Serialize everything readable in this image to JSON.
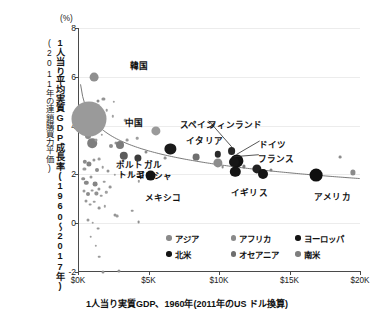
{
  "chart_data": {
    "type": "scatter",
    "title": "",
    "unit_label": "(%)",
    "xlabel": "1人当り実質GDP、1960年(2011年のUS ドル換算)",
    "ylabel": "1人当り平均実質GDP成長率(1960〜2017年)",
    "ylabel_sub": "(2011年の連鎖購買力平価)",
    "xlim": [
      0,
      20000
    ],
    "ylim": [
      -2,
      8
    ],
    "grid": true,
    "legend_position": "inside-bottom-right",
    "xticks": [
      {
        "value": 0,
        "label": "$0K"
      },
      {
        "value": 5000,
        "label": "$5K"
      },
      {
        "value": 10000,
        "label": "$10K"
      },
      {
        "value": 15000,
        "label": "$15K"
      },
      {
        "value": 20000,
        "label": "$20K"
      }
    ],
    "yticks": [
      {
        "value": -2,
        "label": "-2"
      },
      {
        "value": 0,
        "label": "0"
      },
      {
        "value": 2,
        "label": "2"
      },
      {
        "value": 4,
        "label": "4"
      },
      {
        "value": 6,
        "label": "6"
      },
      {
        "value": 8,
        "label": "8"
      }
    ],
    "legend": [
      {
        "name": "アジア",
        "color": "#8a8a8a"
      },
      {
        "name": "アフリカ",
        "color": "#8a8a8a"
      },
      {
        "name": "ヨーロッパ",
        "color": "#141414"
      },
      {
        "name": "北米",
        "color": "#141414"
      },
      {
        "name": "オセアニア",
        "color": "#6e6e6e"
      },
      {
        "name": "南米",
        "color": "#7e7e7e"
      }
    ],
    "trend_note": "downward-sloping fitted convergence curve",
    "labeled_points": [
      {
        "label": "韓国",
        "x": 1150,
        "y": 5.98,
        "r": 4.4,
        "color": "#8f8f8f",
        "lx": 36,
        "ly": -13,
        "leader": false
      },
      {
        "label": "中国",
        "x": 800,
        "y": 4.28,
        "r": 17.5,
        "color": "#9a9a9a",
        "lx": 36,
        "ly": 2,
        "leader": false
      },
      {
        "label": "ポルトガル",
        "x": 3000,
        "y": 3.22,
        "r": 4.0,
        "color": "#7b7b7b",
        "lx": -4,
        "ly": 18,
        "leader": false
      },
      {
        "label": "トルコ",
        "x": 3250,
        "y": 2.75,
        "r": 4.2,
        "color": "#5c5c5c",
        "lx": -6,
        "ly": 17,
        "leader": false
      },
      {
        "label": "スペイン",
        "x": 5500,
        "y": 3.78,
        "r": 4.6,
        "color": "#9a9a9a",
        "lx": 24,
        "ly": -8,
        "leader": false
      },
      {
        "label": "イタリア",
        "x": 6550,
        "y": 3.06,
        "r": 5.6,
        "color": "#1a1a1a",
        "lx": 16,
        "ly": -10,
        "leader": false
      },
      {
        "label": "ギリシャ",
        "x": 4250,
        "y": 2.68,
        "r": 3.6,
        "color": "#3c3c3c",
        "lx": -2,
        "ly": 16,
        "leader": false
      },
      {
        "label": "メキシコ",
        "x": 5150,
        "y": 1.95,
        "r": 5.4,
        "color": "#141414",
        "lx": -6,
        "ly": 20,
        "leader": false
      },
      {
        "label": "フィンランド",
        "x": 10900,
        "y": 2.97,
        "r": 3.9,
        "color": "#262626",
        "lx": -24,
        "ly": -28,
        "leader": true
      },
      {
        "label": "ドイツ",
        "x": 11250,
        "y": 2.55,
        "r": 6.6,
        "color": "#111111",
        "lx": 22,
        "ly": -18,
        "leader": true
      },
      {
        "label": "フランス",
        "x": 11050,
        "y": 2.52,
        "r": 5.0,
        "color": "#161616",
        "lx": 24,
        "ly": -5,
        "leader": true
      },
      {
        "label": "イギリス",
        "x": 11150,
        "y": 2.1,
        "r": 5.2,
        "color": "#141414",
        "lx": -4,
        "ly": 19,
        "leader": false
      },
      {
        "label": "アメリカ",
        "x": 16900,
        "y": 1.96,
        "r": 6.4,
        "color": "#0f0f0f",
        "lx": -2,
        "ly": 20,
        "leader": false
      }
    ],
    "unlabeled_points": [
      {
        "x": 1400,
        "y": 5.02,
        "r": 1.5,
        "color": "#8d8d8d"
      },
      {
        "x": 1800,
        "y": 5.08,
        "r": 1.6,
        "color": "#949494"
      },
      {
        "x": 1550,
        "y": 4.52,
        "r": 1.4,
        "color": "#9d9d9d"
      },
      {
        "x": 2050,
        "y": 4.62,
        "r": 1.3,
        "color": "#9a9a9a"
      },
      {
        "x": 2450,
        "y": 4.38,
        "r": 1.2,
        "color": "#a2a2a2"
      },
      {
        "x": 3350,
        "y": 4.22,
        "r": 1.3,
        "color": "#9c9c9c"
      },
      {
        "x": 700,
        "y": 3.58,
        "r": 3.0,
        "color": "#8a8a8a"
      },
      {
        "x": 1000,
        "y": 3.28,
        "r": 4.8,
        "color": "#7e7e7e"
      },
      {
        "x": 1250,
        "y": 3.4,
        "r": 1.5,
        "color": "#9b9b9b"
      },
      {
        "x": 1700,
        "y": 3.62,
        "r": 1.2,
        "color": "#a0a0a0"
      },
      {
        "x": 2350,
        "y": 3.15,
        "r": 2.0,
        "color": "#8f8f8f"
      },
      {
        "x": 2700,
        "y": 3.3,
        "r": 1.6,
        "color": "#949494"
      },
      {
        "x": 3500,
        "y": 3.4,
        "r": 1.4,
        "color": "#9a9a9a"
      },
      {
        "x": 4200,
        "y": 3.48,
        "r": 1.3,
        "color": "#9e9e9e"
      },
      {
        "x": 4800,
        "y": 2.92,
        "r": 1.5,
        "color": "#8c8c8c"
      },
      {
        "x": 5600,
        "y": 2.52,
        "r": 1.3,
        "color": "#9a9a9a"
      },
      {
        "x": 6200,
        "y": 2.68,
        "r": 1.4,
        "color": "#909090"
      },
      {
        "x": 8400,
        "y": 2.72,
        "r": 3.4,
        "color": "#6f6f6f"
      },
      {
        "x": 9950,
        "y": 2.46,
        "r": 4.6,
        "color": "#8d8d8d"
      },
      {
        "x": 9900,
        "y": 2.82,
        "r": 3.2,
        "color": "#2a2a2a"
      },
      {
        "x": 10250,
        "y": 2.3,
        "r": 1.4,
        "color": "#8e8e8e"
      },
      {
        "x": 11750,
        "y": 2.33,
        "r": 1.6,
        "color": "#7a7a7a"
      },
      {
        "x": 12700,
        "y": 2.24,
        "r": 4.6,
        "color": "#222222"
      },
      {
        "x": 13100,
        "y": 2.02,
        "r": 5.0,
        "color": "#141414"
      },
      {
        "x": 13700,
        "y": 2.18,
        "r": 1.5,
        "color": "#808080"
      },
      {
        "x": 18600,
        "y": 2.72,
        "r": 1.4,
        "color": "#8c8c8c"
      },
      {
        "x": 19500,
        "y": 2.08,
        "r": 2.6,
        "color": "#8a8a8a"
      },
      {
        "x": 500,
        "y": 2.52,
        "r": 2.2,
        "color": "#8b8b8b"
      },
      {
        "x": 450,
        "y": 2.22,
        "r": 1.6,
        "color": "#9a9a9a"
      },
      {
        "x": 800,
        "y": 2.42,
        "r": 2.6,
        "color": "#838383"
      },
      {
        "x": 1100,
        "y": 2.6,
        "r": 1.6,
        "color": "#969696"
      },
      {
        "x": 1350,
        "y": 2.18,
        "r": 2.0,
        "color": "#8d8d8d"
      },
      {
        "x": 1500,
        "y": 2.62,
        "r": 1.4,
        "color": "#9b9b9b"
      },
      {
        "x": 1750,
        "y": 2.3,
        "r": 1.3,
        "color": "#9e9e9e"
      },
      {
        "x": 2100,
        "y": 2.12,
        "r": 1.5,
        "color": "#949494"
      },
      {
        "x": 2600,
        "y": 1.98,
        "r": 1.2,
        "color": "#a0a0a0"
      },
      {
        "x": 3100,
        "y": 2.02,
        "r": 1.3,
        "color": "#999999"
      },
      {
        "x": 3700,
        "y": 2.06,
        "r": 1.4,
        "color": "#939393"
      },
      {
        "x": 4300,
        "y": 1.72,
        "r": 1.2,
        "color": "#9e9e9e"
      },
      {
        "x": 350,
        "y": 1.82,
        "r": 1.8,
        "color": "#8e8e8e"
      },
      {
        "x": 600,
        "y": 1.66,
        "r": 2.2,
        "color": "#888888"
      },
      {
        "x": 900,
        "y": 1.88,
        "r": 1.5,
        "color": "#979797"
      },
      {
        "x": 1200,
        "y": 1.6,
        "r": 2.4,
        "color": "#858585"
      },
      {
        "x": 1500,
        "y": 1.42,
        "r": 1.6,
        "color": "#949494"
      },
      {
        "x": 1850,
        "y": 1.7,
        "r": 1.3,
        "color": "#9c9c9c"
      },
      {
        "x": 2300,
        "y": 1.48,
        "r": 1.4,
        "color": "#969696"
      },
      {
        "x": 400,
        "y": 1.3,
        "r": 1.5,
        "color": "#9a9a9a"
      },
      {
        "x": 700,
        "y": 1.18,
        "r": 2.0,
        "color": "#8c8c8c"
      },
      {
        "x": 1000,
        "y": 1.34,
        "r": 1.4,
        "color": "#989898"
      },
      {
        "x": 1300,
        "y": 1.22,
        "r": 1.6,
        "color": "#929292"
      },
      {
        "x": 1650,
        "y": 1.12,
        "r": 1.3,
        "color": "#9d9d9d"
      },
      {
        "x": 2000,
        "y": 1.26,
        "r": 1.2,
        "color": "#a1a1a1"
      },
      {
        "x": 550,
        "y": 0.92,
        "r": 1.5,
        "color": "#979797"
      },
      {
        "x": 850,
        "y": 0.76,
        "r": 1.4,
        "color": "#9a9a9a"
      },
      {
        "x": 1150,
        "y": 0.88,
        "r": 1.3,
        "color": "#9e9e9e"
      },
      {
        "x": 1500,
        "y": 0.62,
        "r": 1.4,
        "color": "#959595"
      },
      {
        "x": 1900,
        "y": 0.7,
        "r": 1.2,
        "color": "#a0a0a0"
      },
      {
        "x": 2600,
        "y": 0.34,
        "r": 1.5,
        "color": "#949494"
      },
      {
        "x": 2750,
        "y": 0.28,
        "r": 1.4,
        "color": "#9b9b9b"
      },
      {
        "x": 3850,
        "y": 0.52,
        "r": 1.3,
        "color": "#989898"
      },
      {
        "x": 4300,
        "y": 0.06,
        "r": 1.4,
        "color": "#8f8f8f"
      },
      {
        "x": 700,
        "y": 0.12,
        "r": 1.5,
        "color": "#999999"
      },
      {
        "x": 1050,
        "y": 0.02,
        "r": 1.3,
        "color": "#9e9e9e"
      },
      {
        "x": 1400,
        "y": -0.22,
        "r": 1.4,
        "color": "#969696"
      },
      {
        "x": 900,
        "y": -0.56,
        "r": 1.3,
        "color": "#9c9c9c"
      },
      {
        "x": 1250,
        "y": -0.92,
        "r": 1.2,
        "color": "#a1a1a1"
      },
      {
        "x": 1500,
        "y": -1.38,
        "r": 1.3,
        "color": "#9a9a9a"
      },
      {
        "x": 1750,
        "y": -2.02,
        "r": 1.5,
        "color": "#909090"
      },
      {
        "x": 2900,
        "y": -1.96,
        "r": 1.6,
        "color": "#8d8d8d"
      },
      {
        "x": 2550,
        "y": 4.98,
        "r": 1.2,
        "color": "#a0a0a0"
      }
    ]
  }
}
